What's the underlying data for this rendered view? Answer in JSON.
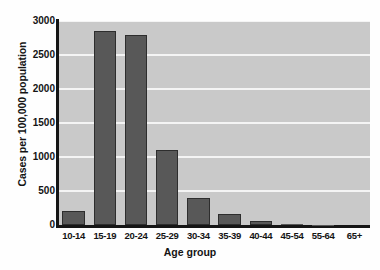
{
  "chart_data": {
    "type": "bar",
    "title": "",
    "xlabel": "Age group",
    "ylabel": "Cases per 100,000 population",
    "categories": [
      "10-14",
      "15-19",
      "20-24",
      "25-29",
      "30-34",
      "35-39",
      "40-44",
      "45-54",
      "55-64",
      "65+"
    ],
    "values": [
      205,
      2850,
      2795,
      1110,
      395,
      155,
      55,
      15,
      3,
      1
    ],
    "ylim": [
      0,
      3000
    ],
    "yticks": [
      0,
      500,
      1000,
      1500,
      2000,
      2500,
      3000
    ],
    "ytick_labels": [
      "0",
      "500",
      "1000",
      "1500",
      "2000",
      "2500",
      "3000"
    ],
    "grid": true,
    "grid_axis": "y",
    "grid_color": "#f4f4f4",
    "legend": false,
    "bar_color": "#585858",
    "bar_edge_color": "#2d2d2d",
    "plot_background": "#c9c9c9",
    "figure_background": "#fefefe",
    "axis_color": "#151515",
    "text_color": "#141414"
  },
  "axes": {
    "y_title": "Cases per 100,000 population",
    "x_title": "Age group"
  }
}
